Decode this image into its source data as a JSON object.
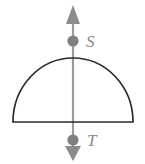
{
  "figure": {
    "canvas": {
      "width": 145,
      "height": 164,
      "background": "#ffffff"
    },
    "colors": {
      "outline": "#2b2b2b",
      "axis": "#9a9a9a",
      "marker": "#808080",
      "arrowhead": "#8c8c8c",
      "label": "#8a8a8a"
    },
    "shapes": {
      "semicircle": {
        "name": "semicircle",
        "baseline_y": 122,
        "left_x": 13,
        "right_x": 133,
        "apex_y": 57,
        "stroke_width": 1.6
      },
      "axis_line": {
        "name": "vertical-axis",
        "x": 73,
        "y_top": 20,
        "y_bottom": 150,
        "stroke_width": 2
      },
      "arrow_up": {
        "name": "arrow-up",
        "tip_y": 5,
        "base_y": 24,
        "half_width": 7
      },
      "arrow_down": {
        "name": "arrow-down",
        "tip_y": 161,
        "base_y": 146,
        "half_width": 8
      }
    },
    "points": [
      {
        "id": "S",
        "label": "S",
        "cx": 73,
        "cy": 41,
        "r": 5.5,
        "label_x": 86,
        "label_y": 47
      },
      {
        "id": "T",
        "label": "T",
        "cx": 73,
        "cy": 140,
        "r": 5.5,
        "label_x": 87,
        "label_y": 145
      }
    ]
  }
}
